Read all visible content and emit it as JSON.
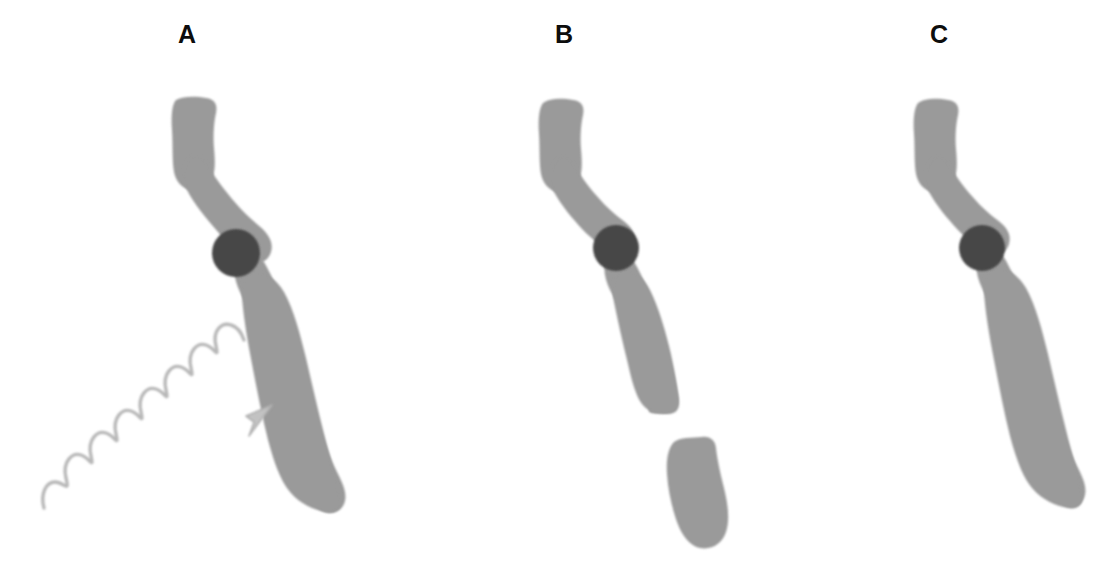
{
  "figure": {
    "background_color": "#ffffff",
    "width": 1111,
    "height": 576,
    "caption": "",
    "strand_color": "#9a9a9a",
    "strand_edge_color": "#9a9a9a",
    "particle_color": "#464646",
    "arrow_color": "#b8b8b8",
    "label_color": "#0d0d0d"
  },
  "panels": [
    {
      "id": "a",
      "label": "A",
      "state": "intact-irradiated",
      "strand": {
        "intact": true,
        "segments": 1,
        "color": "#9a9a9a"
      },
      "particle": {
        "present": true,
        "color": "#464646",
        "cx": 236,
        "cy": 253,
        "r": 24
      },
      "wavy_arrow": {
        "present": true,
        "color": "#b8b8b8",
        "label": "incident radiation",
        "direction": "up-right",
        "start_x": 44,
        "start_y": 508,
        "tip_x": 272,
        "tip_y": 410,
        "cycles": 6
      }
    },
    {
      "id": "b",
      "label": "B",
      "state": "cleaved",
      "strand": {
        "intact": false,
        "segments": 2,
        "color": "#9a9a9a",
        "break_gap_top_y": 412,
        "break_gap_bottom_y": 437
      },
      "particle": {
        "present": true,
        "color": "#464646",
        "cx": 616,
        "cy": 248,
        "r": 23
      },
      "wavy_arrow": {
        "present": false
      }
    },
    {
      "id": "c",
      "label": "C",
      "state": "intact",
      "strand": {
        "intact": true,
        "segments": 1,
        "color": "#9a9a9a"
      },
      "particle": {
        "present": true,
        "color": "#464646",
        "cx": 982,
        "cy": 248,
        "r": 23
      },
      "wavy_arrow": {
        "present": false
      }
    }
  ]
}
